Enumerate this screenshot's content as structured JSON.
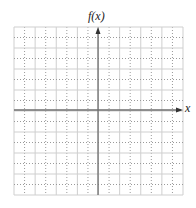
{
  "chart_data": {
    "type": "grid",
    "title": "",
    "xlabel": "x",
    "ylabel": "f(x)",
    "grid": {
      "columns": 16,
      "rows": 16,
      "left": 14,
      "top": 27,
      "right": 183,
      "bottom": 195,
      "line_pattern": "alternating solid / dotted",
      "solid_color": "#cfcfcf",
      "dotted_color": "#9a9a9a"
    },
    "axes": {
      "x_axis_y": 110,
      "y_axis_x": 98,
      "color": "#6e6e6e",
      "arrow_right": true,
      "arrow_up": true
    },
    "ticks": [],
    "series": []
  },
  "labels": {
    "y_axis": "f(x)",
    "x_axis": "x"
  }
}
